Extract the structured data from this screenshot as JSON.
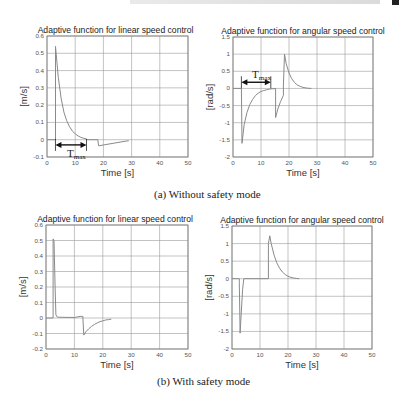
{
  "page": {
    "captions": [
      "(a)  Without safety mode",
      "(b)  With safety mode"
    ]
  },
  "chart_data": [
    {
      "type": "line",
      "panel": "(a) Without safety mode",
      "title": "Adaptive function for linear speed control",
      "xlabel": "Time [s]",
      "ylabel": "[m/s]",
      "xlim": [
        0,
        50
      ],
      "ylim": [
        -0.1,
        0.6
      ],
      "xticks": [
        0,
        10,
        20,
        30,
        40,
        50
      ],
      "yticks": [
        -0.1,
        0,
        0.1,
        0.2,
        0.3,
        0.4,
        0.5,
        0.6
      ],
      "grid": true,
      "series": [
        {
          "name": "linear",
          "x": [
            0,
            3,
            3,
            4,
            5,
            6,
            7,
            8,
            9,
            10,
            11,
            12,
            13,
            14,
            14,
            18,
            18,
            18.3,
            28,
            29
          ],
          "y": [
            0,
            0,
            0.54,
            0.36,
            0.24,
            0.16,
            0.11,
            0.075,
            0.05,
            0.034,
            0.022,
            0.014,
            0.008,
            0.004,
            0,
            0,
            0,
            -0.035,
            -0.008,
            -0.006
          ]
        }
      ],
      "annotations": [
        {
          "text": "T",
          "sub": "max",
          "x_from": 3,
          "x_to": 14,
          "y": -0.03
        }
      ]
    },
    {
      "type": "line",
      "panel": "(a) Without safety mode",
      "title": "Adaptive function for angular speed control",
      "xlabel": "Time [s]",
      "ylabel": "[rad/s]",
      "xlim": [
        0,
        50
      ],
      "ylim": [
        -2,
        1.5
      ],
      "xticks": [
        0,
        10,
        20,
        30,
        40,
        50
      ],
      "yticks": [
        -2,
        -1.5,
        -1,
        -0.5,
        0,
        0.5,
        1,
        1.5
      ],
      "grid": true,
      "series": [
        {
          "name": "angular",
          "x": [
            0,
            3,
            3.2,
            4,
            5,
            6,
            7,
            8,
            9,
            10,
            11,
            12,
            13,
            14,
            15,
            15.2,
            15.2,
            16,
            17,
            18,
            18,
            18.4,
            19,
            20,
            21,
            22,
            23,
            24,
            25,
            26,
            27,
            28
          ],
          "y": [
            0,
            0,
            -1.6,
            -1.05,
            -0.7,
            -0.47,
            -0.32,
            -0.21,
            -0.14,
            -0.09,
            -0.06,
            -0.04,
            -0.02,
            -0.01,
            -0.005,
            0,
            -0.85,
            -0.6,
            -0.38,
            -0.2,
            0.1,
            1.0,
            0.72,
            0.45,
            0.28,
            0.17,
            0.1,
            0.06,
            0.03,
            0.015,
            0.005,
            0
          ]
        }
      ],
      "annotations": [
        {
          "text": "T",
          "sub": "max",
          "x_from": 3,
          "x_to": 13.5,
          "y": 0.18
        }
      ]
    },
    {
      "type": "line",
      "panel": "(b) With safety mode",
      "title": "Adaptive function for linear speed control",
      "xlabel": "Time [s]",
      "ylabel": "[m/s]",
      "xlim": [
        0,
        50
      ],
      "ylim": [
        -0.2,
        0.6
      ],
      "xticks": [
        0,
        10,
        20,
        30,
        40,
        50
      ],
      "yticks": [
        -0.2,
        -0.1,
        0,
        0.1,
        0.2,
        0.3,
        0.4,
        0.5,
        0.6
      ],
      "grid": true,
      "series": [
        {
          "name": "linear",
          "x": [
            0,
            2.5,
            2.5,
            2.8,
            3.2,
            3.5,
            4,
            10,
            12,
            13,
            13,
            13.3,
            14,
            15,
            16,
            17,
            18,
            19,
            20,
            21,
            22,
            23
          ],
          "y": [
            0,
            0,
            0.51,
            0.5,
            0.2,
            0.02,
            0.005,
            0.003,
            0.01,
            0.01,
            0,
            -0.11,
            -0.09,
            -0.07,
            -0.055,
            -0.042,
            -0.032,
            -0.024,
            -0.018,
            -0.013,
            -0.01,
            -0.008
          ]
        }
      ]
    },
    {
      "type": "line",
      "panel": "(b) With safety mode",
      "title": "Adaptive function for angular speed control",
      "xlabel": "Time [s]",
      "ylabel": "[rad/s]",
      "xlim": [
        0,
        50
      ],
      "ylim": [
        -2,
        1.5
      ],
      "xticks": [
        0,
        10,
        20,
        30,
        40,
        50
      ],
      "yticks": [
        -2,
        -1.5,
        -1,
        -0.5,
        0,
        0.5,
        1,
        1.5
      ],
      "grid": true,
      "series": [
        {
          "name": "angular",
          "x": [
            0,
            2.6,
            2.6,
            2.9,
            3.3,
            3.8,
            4.2,
            10,
            13,
            13,
            13.5,
            14,
            15,
            16,
            17,
            18,
            19,
            20,
            21,
            22,
            23,
            24
          ],
          "y": [
            0,
            0,
            -0.1,
            -1.55,
            -1.0,
            -0.3,
            0,
            0,
            0,
            1.0,
            1.22,
            1.0,
            0.68,
            0.45,
            0.3,
            0.19,
            0.12,
            0.07,
            0.04,
            0.02,
            0.01,
            0
          ]
        }
      ]
    }
  ]
}
